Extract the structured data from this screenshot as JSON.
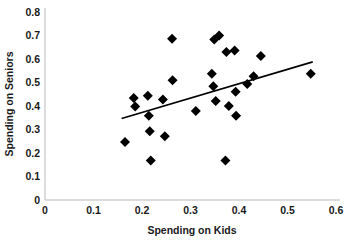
{
  "chart_data": {
    "type": "scatter",
    "title": "",
    "xlabel": "Spending on Kids",
    "ylabel": "Spending on Seniors",
    "xlim": [
      0,
      0.6
    ],
    "ylim": [
      0,
      0.8
    ],
    "xticks": [
      "0",
      "0.1",
      "0.2",
      "0.3",
      "0.4",
      "0.5",
      "0.6"
    ],
    "xtick_values": [
      0,
      0.1,
      0.2,
      0.3,
      0.4,
      0.5,
      0.6
    ],
    "yticks": [
      "0",
      "0.1",
      "0.2",
      "0.3",
      "0.4",
      "0.5",
      "0.6",
      "0.7",
      "0.8"
    ],
    "ytick_values": [
      0,
      0.1,
      0.2,
      0.3,
      0.4,
      0.5,
      0.6,
      0.7,
      0.8
    ],
    "grid": false,
    "legend": false,
    "marker_shape": "diamond",
    "marker_color": "#000000",
    "series": [
      {
        "name": "States",
        "points": [
          [
            0.165,
            0.247
          ],
          [
            0.183,
            0.434
          ],
          [
            0.186,
            0.398
          ],
          [
            0.212,
            0.444
          ],
          [
            0.214,
            0.358
          ],
          [
            0.216,
            0.293
          ],
          [
            0.218,
            0.168
          ],
          [
            0.243,
            0.428
          ],
          [
            0.247,
            0.271
          ],
          [
            0.262,
            0.686
          ],
          [
            0.263,
            0.51
          ],
          [
            0.311,
            0.379
          ],
          [
            0.344,
            0.537
          ],
          [
            0.347,
            0.484
          ],
          [
            0.349,
            0.683
          ],
          [
            0.352,
            0.421
          ],
          [
            0.359,
            0.7
          ],
          [
            0.372,
            0.168
          ],
          [
            0.374,
            0.63
          ],
          [
            0.379,
            0.4
          ],
          [
            0.391,
            0.636
          ],
          [
            0.393,
            0.461
          ],
          [
            0.394,
            0.359
          ],
          [
            0.417,
            0.494
          ],
          [
            0.43,
            0.527
          ],
          [
            0.445,
            0.613
          ],
          [
            0.548,
            0.537
          ]
        ]
      }
    ],
    "trendline": {
      "type": "linear",
      "x_start": 0.158,
      "y_start": 0.347,
      "x_end": 0.552,
      "y_end": 0.588
    }
  }
}
